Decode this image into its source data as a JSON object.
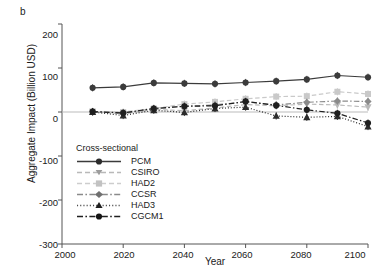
{
  "panel": {
    "label": "b"
  },
  "axes": {
    "x_title": "Year",
    "y_title": "Aggregate Impact (Billion USD)",
    "x_ticks": [
      "2000",
      "2020",
      "2040",
      "2060",
      "2080",
      "2100"
    ],
    "y_ticks": [
      "200",
      "100",
      "0",
      "-100",
      "-200",
      "-300"
    ]
  },
  "legend": {
    "title": "Cross-sectional",
    "items": [
      {
        "label": "PCM"
      },
      {
        "label": "CSIRO"
      },
      {
        "label": "HAD2"
      },
      {
        "label": "CCSR"
      },
      {
        "label": "HAD3"
      },
      {
        "label": "CGCM1"
      }
    ]
  },
  "colors": {
    "pcm": "#3b3b3b",
    "csiro": "#b9b9b9",
    "had2": "#c9c9c9",
    "ccsr": "#8a8a8a",
    "had3": "#2b2b2b",
    "cgcm1": "#1f1f1f",
    "axis": "#555555",
    "zero_line": "#bbbbbb"
  },
  "chart_data": {
    "type": "line",
    "title": "",
    "xlabel": "Year",
    "ylabel": "Aggregate Impact (Billion USD)",
    "xlim": [
      2000,
      2100
    ],
    "ylim": [
      -300,
      200
    ],
    "grid": false,
    "legend_position": "lower-left-inside",
    "legend_title": "Cross-sectional",
    "x": [
      2010,
      2020,
      2030,
      2040,
      2050,
      2060,
      2070,
      2080,
      2090,
      2100
    ],
    "series": [
      {
        "name": "PCM",
        "marker": "circle",
        "linestyle": "solid",
        "color": "#3b3b3b",
        "values": [
          55,
          57,
          66,
          65,
          64,
          67,
          70,
          74,
          83,
          79
        ]
      },
      {
        "name": "CSIRO",
        "marker": "triangle-down",
        "linestyle": "dashed",
        "color": "#b9b9b9",
        "values": [
          1,
          -4,
          6,
          3,
          9,
          17,
          14,
          18,
          16,
          11
        ]
      },
      {
        "name": "HAD2",
        "marker": "square",
        "linestyle": "dashed",
        "color": "#c9c9c9",
        "values": [
          1,
          0,
          8,
          18,
          23,
          30,
          35,
          36,
          46,
          41
        ]
      },
      {
        "name": "CCSR",
        "marker": "diamond",
        "linestyle": "dash-dot",
        "color": "#8a8a8a",
        "values": [
          1,
          -3,
          7,
          13,
          16,
          23,
          16,
          22,
          25,
          24
        ]
      },
      {
        "name": "HAD3",
        "marker": "triangle-up",
        "linestyle": "dotted",
        "color": "#2b2b2b",
        "values": [
          0,
          -8,
          4,
          -1,
          8,
          11,
          -9,
          -12,
          -10,
          -33
        ]
      },
      {
        "name": "CGCM1",
        "marker": "circle",
        "linestyle": "dash-dot",
        "color": "#1f1f1f",
        "values": [
          1,
          -2,
          8,
          13,
          14,
          24,
          15,
          5,
          -3,
          -25
        ]
      }
    ],
    "error_bars": {
      "present": true,
      "description": "small vertical caps on most markers"
    }
  }
}
